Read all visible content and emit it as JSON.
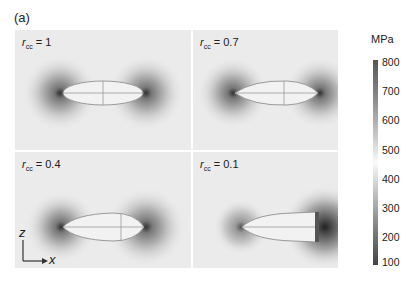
{
  "figure": {
    "panel_letter": "(a)",
    "panels": [
      {
        "id": "p1",
        "var": "r",
        "sub": "cc",
        "eq": " = 1"
      },
      {
        "id": "p2",
        "var": "r",
        "sub": "cc",
        "eq": " = 0.7"
      },
      {
        "id": "p3",
        "var": "r",
        "sub": "cc",
        "eq": " = 0.4"
      },
      {
        "id": "p4",
        "var": "r",
        "sub": "cc",
        "eq": " = 0.1"
      }
    ],
    "colorbar": {
      "unit": "MPa",
      "ticks": [
        "800",
        "700",
        "600",
        "500",
        "400",
        "300",
        "200",
        "100"
      ]
    },
    "axes": {
      "vertical": "z",
      "horizontal": "x"
    }
  }
}
